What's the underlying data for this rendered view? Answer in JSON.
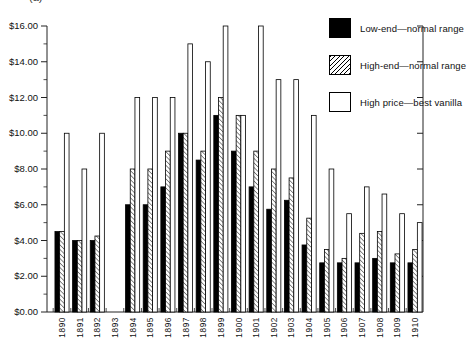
{
  "figure_label": "(a)",
  "y_axis": {
    "tick_labels": [
      "$0.00",
      "$2.00",
      "$4.00",
      "$6.00",
      "$8.00",
      "$10.00",
      "$12.00",
      "$14.00",
      "$16.00"
    ],
    "min": 0,
    "max": 16,
    "major_step": 2,
    "minor_step": 1
  },
  "legend": {
    "items": [
      {
        "label": "Low-end—normal range",
        "swatch": "solid-black"
      },
      {
        "label": "High-end—normal range",
        "swatch": "diagonal-hatch"
      },
      {
        "label": "High price—best vanilla",
        "swatch": "white-outline"
      }
    ]
  },
  "chart_data": {
    "type": "bar",
    "title": "",
    "xlabel": "",
    "ylabel": "",
    "ylim": [
      0,
      16
    ],
    "grid": false,
    "legend_position": "top-right-inside",
    "categories": [
      "1890",
      "1891",
      "1892",
      "1893",
      "1894",
      "1895",
      "1896",
      "1897",
      "1898",
      "1899",
      "1900",
      "1901",
      "1902",
      "1903",
      "1904",
      "1905",
      "1906",
      "1907",
      "1908",
      "1909",
      "1910"
    ],
    "series": [
      {
        "name": "Low-end—normal range",
        "style": "solid-black",
        "values": [
          4.5,
          4.0,
          4.0,
          null,
          6.0,
          6.0,
          7.0,
          10.0,
          8.5,
          11.0,
          9.0,
          7.0,
          5.75,
          6.25,
          3.75,
          2.75,
          2.75,
          2.75,
          3.0,
          2.75,
          2.75
        ]
      },
      {
        "name": "High-end—normal range",
        "style": "diagonal-hatch",
        "values": [
          4.5,
          4.0,
          4.25,
          null,
          8.0,
          8.0,
          9.0,
          10.0,
          9.0,
          12.0,
          11.0,
          9.0,
          8.0,
          7.5,
          5.25,
          3.5,
          3.0,
          4.4,
          4.5,
          3.25,
          3.5
        ]
      },
      {
        "name": "High price—best vanilla",
        "style": "white-outline",
        "values": [
          10.0,
          8.0,
          10.0,
          null,
          12.0,
          12.0,
          12.0,
          15.0,
          14.0,
          16.0,
          11.0,
          16.0,
          13.0,
          13.0,
          11.0,
          8.0,
          5.5,
          7.0,
          6.6,
          5.5,
          5.0
        ]
      }
    ],
    "note": "No bars plotted for 1893"
  }
}
